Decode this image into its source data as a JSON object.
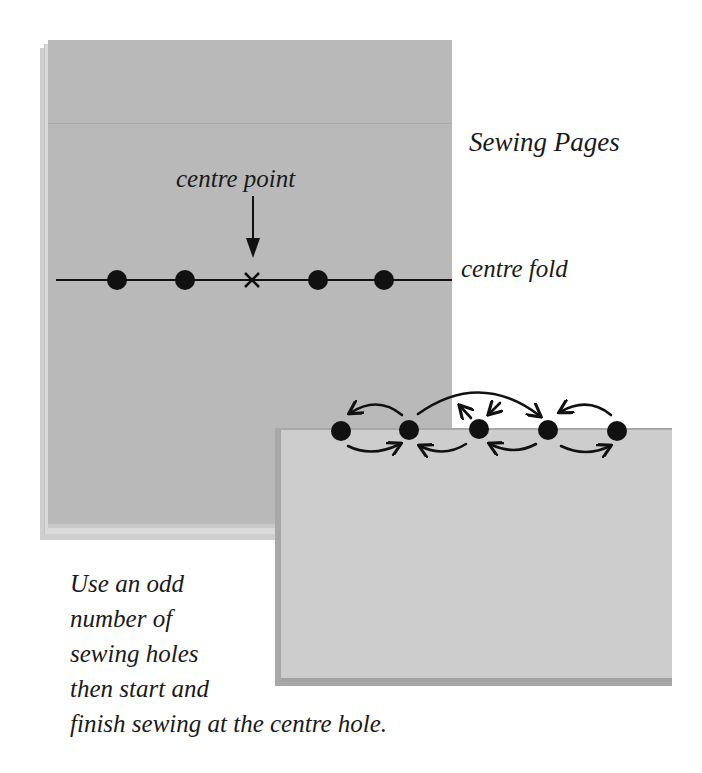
{
  "title": "Sewing Pages",
  "labels": {
    "centre_point": "centre point",
    "centre_fold": "centre fold"
  },
  "instruction": {
    "lines": [
      "Use an odd",
      "number of",
      "sewing holes",
      "then start and",
      "finish sewing at the centre hole."
    ]
  },
  "colors": {
    "page_front": "#b9b9b9",
    "page_back": "#c9c9c9",
    "page_edge": "#d6d6d6",
    "lower_page": "#cdcdcd",
    "lower_page_shadow": "#a8a8a8",
    "ink": "#111111"
  },
  "fold_holes": {
    "count": 5,
    "centre_marker": "cross"
  },
  "stitch_holes": {
    "count": 5
  }
}
